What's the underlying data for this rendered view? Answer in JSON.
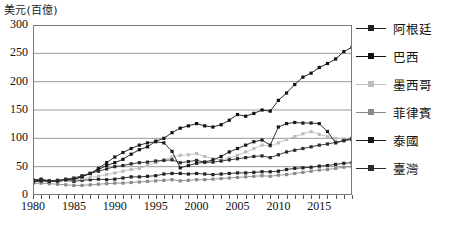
{
  "chart_data": {
    "type": "line",
    "title": "",
    "subtitle": "",
    "ylabel": "美元(百億)",
    "xlabel": "",
    "ylim": [
      0,
      300
    ],
    "yticks": [
      0,
      50,
      100,
      150,
      200,
      250,
      300
    ],
    "xlim": [
      1980,
      2019
    ],
    "xticks": [
      1980,
      1985,
      1990,
      1995,
      2000,
      2005,
      2010,
      2015
    ],
    "grid": "horizontal",
    "legend_position": "right",
    "x": [
      1980,
      1981,
      1982,
      1983,
      1984,
      1985,
      1986,
      1987,
      1988,
      1989,
      1990,
      1991,
      1992,
      1993,
      1994,
      1995,
      1996,
      1997,
      1998,
      1999,
      2000,
      2001,
      2002,
      2003,
      2004,
      2005,
      2006,
      2007,
      2008,
      2009,
      2010,
      2011,
      2012,
      2013,
      2014,
      2015,
      2016,
      2017,
      2018,
      2019
    ],
    "series": [
      {
        "name": "阿根廷",
        "color": "#222222",
        "values": [
          27,
          28,
          25,
          25,
          26,
          24,
          26,
          27,
          28,
          27,
          28,
          30,
          32,
          32,
          33,
          34,
          37,
          38,
          38,
          37,
          38,
          37,
          36,
          37,
          38,
          39,
          39,
          40,
          41,
          41,
          42,
          45,
          47,
          48,
          49,
          51,
          52,
          54,
          56,
          57
        ]
      },
      {
        "name": "巴西",
        "color": "#111111",
        "values": [
          25,
          26,
          24,
          24,
          26,
          27,
          33,
          38,
          45,
          52,
          57,
          63,
          72,
          80,
          85,
          95,
          100,
          110,
          118,
          122,
          126,
          122,
          120,
          124,
          132,
          142,
          139,
          144,
          150,
          148,
          167,
          180,
          195,
          208,
          215,
          225,
          232,
          240,
          253,
          261
        ]
      },
      {
        "name": "墨西哥",
        "color": "#bdbdbd",
        "values": [
          23,
          24,
          25,
          25,
          26,
          27,
          29,
          31,
          33,
          36,
          39,
          42,
          45,
          47,
          52,
          57,
          62,
          67,
          70,
          71,
          73,
          68,
          64,
          62,
          65,
          70,
          76,
          82,
          88,
          86,
          92,
          98,
          103,
          108,
          112,
          107,
          103,
          100,
          99,
          98
        ]
      },
      {
        "name": "菲律賓",
        "color": "#8a8a8a",
        "values": [
          20,
          21,
          20,
          19,
          18,
          17,
          17,
          18,
          19,
          20,
          21,
          21,
          22,
          23,
          24,
          25,
          26,
          27,
          25,
          26,
          27,
          27,
          28,
          29,
          30,
          31,
          32,
          33,
          34,
          33,
          35,
          36,
          38,
          40,
          42,
          44,
          45,
          47,
          49,
          50
        ]
      },
      {
        "name": "泰國",
        "color": "#1a1a1a",
        "values": [
          23,
          25,
          24,
          25,
          27,
          28,
          32,
          38,
          47,
          57,
          67,
          75,
          82,
          88,
          92,
          94,
          92,
          77,
          48,
          52,
          56,
          58,
          62,
          68,
          76,
          82,
          88,
          94,
          97,
          88,
          120,
          126,
          128,
          127,
          127,
          126,
          112,
          92,
          96,
          100
        ]
      },
      {
        "name": "臺灣",
        "color": "#2b2b2b",
        "values": [
          24,
          26,
          25,
          26,
          28,
          30,
          34,
          38,
          42,
          46,
          50,
          52,
          55,
          57,
          58,
          60,
          61,
          62,
          57,
          59,
          61,
          58,
          58,
          60,
          62,
          64,
          66,
          68,
          69,
          66,
          71,
          76,
          79,
          82,
          85,
          88,
          90,
          93,
          96,
          98
        ]
      }
    ]
  },
  "legend": {
    "items": [
      {
        "label": "阿根廷"
      },
      {
        "label": "巴西"
      },
      {
        "label": "墨西哥"
      },
      {
        "label": "菲律賓"
      },
      {
        "label": "泰國"
      },
      {
        "label": "臺灣"
      }
    ]
  }
}
